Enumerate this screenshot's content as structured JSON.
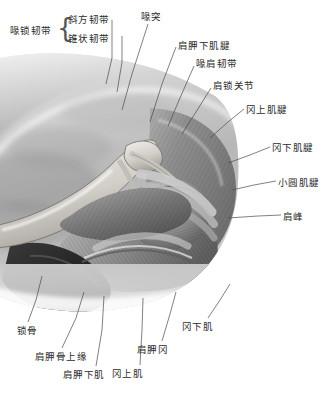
{
  "figure": {
    "type": "anatomical-illustration",
    "palette": {
      "background": "#ffffff",
      "ink": "#2b2b2b",
      "leader_line": "#4a4a4a",
      "tissue_light": "#d9d9d9",
      "tissue_mid": "#9a9a9a",
      "tissue_dark": "#5a5a5a",
      "bone": "#e6e4e0"
    }
  },
  "group_label": {
    "text": "喙锁韧带",
    "brace": "{",
    "members": [
      {
        "text": "斜方韧带"
      },
      {
        "text": "锥状韧带"
      }
    ]
  },
  "labels": [
    {
      "id": "coracoid-process",
      "text": "喙突",
      "x": 141,
      "y": 12,
      "align": "left"
    },
    {
      "id": "subscapularis-tendon",
      "text": "肩胛下肌腱",
      "x": 178,
      "y": 41,
      "align": "left"
    },
    {
      "id": "coracoacromial-ligament",
      "text": "喙肩韧带",
      "x": 196,
      "y": 59,
      "align": "left"
    },
    {
      "id": "acromioclavicular-joint",
      "text": "肩锁关节",
      "x": 213,
      "y": 81,
      "align": "left"
    },
    {
      "id": "supraspinatus-tendon",
      "text": "冈上肌腱",
      "x": 246,
      "y": 105,
      "align": "left"
    },
    {
      "id": "infraspinatus-tendon",
      "text": "冈下肌腱",
      "x": 272,
      "y": 143,
      "align": "left"
    },
    {
      "id": "teres-minor-tendon",
      "text": "小圆肌腱",
      "x": 278,
      "y": 178,
      "align": "left"
    },
    {
      "id": "acromion",
      "text": "肩峰",
      "x": 283,
      "y": 212,
      "align": "left"
    },
    {
      "id": "clavicle",
      "text": "锁骨",
      "x": 17,
      "y": 326,
      "align": "left"
    },
    {
      "id": "superior-border-scapula",
      "text": "肩胛骨上缘",
      "x": 35,
      "y": 352,
      "align": "left"
    },
    {
      "id": "subscapularis",
      "text": "肩胛下肌",
      "x": 63,
      "y": 370,
      "align": "left"
    },
    {
      "id": "supraspinatus",
      "text": "冈上肌",
      "x": 112,
      "y": 369,
      "align": "left"
    },
    {
      "id": "spine-of-scapula",
      "text": "肩胛冈",
      "x": 137,
      "y": 345,
      "align": "left"
    },
    {
      "id": "infraspinatus",
      "text": "冈下肌",
      "x": 182,
      "y": 322,
      "align": "left"
    }
  ],
  "leaders": [
    {
      "for": "trapezoid-ligament",
      "points": "112,20 112,58 106,84"
    },
    {
      "for": "conoid-ligament",
      "points": "122,36 122,62 117,92"
    },
    {
      "for": "coracoid-process",
      "points": "148,24 132,74 122,110"
    },
    {
      "for": "subscapularis-tendon",
      "points": "176,47 162,84 150,122"
    },
    {
      "for": "coracoacromial-ligament",
      "points": "194,66 180,98 168,126"
    },
    {
      "for": "acromioclavicular-joint",
      "points": "211,88 196,112 182,134"
    },
    {
      "for": "supraspinatus-tendon",
      "points": "244,109 228,122 210,138"
    },
    {
      "for": "infraspinatus-tendon",
      "points": "270,147 250,155 228,163"
    },
    {
      "for": "teres-minor-tendon",
      "points": "276,181 254,185 232,190"
    },
    {
      "for": "acromion",
      "points": "281,215 258,216 228,218"
    },
    {
      "for": "clavicle",
      "points": "28,322 36,300 42,276"
    },
    {
      "for": "superior-border-scapula",
      "points": "62,348 76,318 84,292"
    },
    {
      "for": "subscapularis",
      "points": "96,366 102,330 104,296"
    },
    {
      "for": "supraspinatus",
      "points": "140,365 142,330 143,298"
    },
    {
      "for": "spine-of-scapula",
      "points": "162,341 170,314 176,292"
    },
    {
      "for": "infraspinatus",
      "points": "208,318 220,300 230,284"
    }
  ]
}
